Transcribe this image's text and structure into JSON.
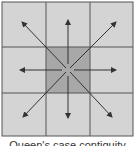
{
  "diagram": {
    "title": "Queen's case contiguity",
    "grid": {
      "rows": 3,
      "cols": 3
    },
    "colors": {
      "cell": "#d4d4d4",
      "center_cell": "#a8a8a8",
      "grid_line": "#555555",
      "arrow": "#333333"
    },
    "arrows": [
      {
        "direction": "north-west"
      },
      {
        "direction": "north"
      },
      {
        "direction": "north-east"
      },
      {
        "direction": "west"
      },
      {
        "direction": "east"
      },
      {
        "direction": "south-west"
      },
      {
        "direction": "south"
      },
      {
        "direction": "south-east"
      }
    ]
  },
  "caption": "Queen's case contiguity"
}
